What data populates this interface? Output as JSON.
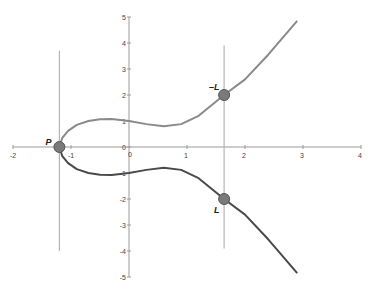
{
  "chart_data": {
    "type": "line",
    "title": "",
    "xlabel": "",
    "ylabel": "",
    "xlim": [
      -2,
      4
    ],
    "ylim": [
      -5,
      5
    ],
    "x_ticks": [
      "-2",
      "-1",
      "0",
      "1",
      "2",
      "3",
      "4"
    ],
    "y_ticks": [
      "5",
      "4",
      "3",
      "2",
      "1",
      "0",
      "-1",
      "-2",
      "-3",
      "-4",
      "-5"
    ],
    "grid": false,
    "series": [
      {
        "name": "upper branch",
        "color": "#8a8a8a",
        "x": [
          -1.2,
          -1.15,
          -1.05,
          -0.9,
          -0.7,
          -0.5,
          -0.3,
          0,
          0.3,
          0.6,
          0.9,
          1.2,
          1.64,
          2.0,
          2.4,
          2.9
        ],
        "y": [
          0,
          0.35,
          0.62,
          0.85,
          1.0,
          1.07,
          1.08,
          1.0,
          0.88,
          0.8,
          0.88,
          1.2,
          2.0,
          2.6,
          3.55,
          4.85
        ]
      },
      {
        "name": "lower branch",
        "color": "#4a4a4a",
        "x": [
          -1.2,
          -1.15,
          -1.05,
          -0.9,
          -0.7,
          -0.5,
          -0.3,
          0,
          0.3,
          0.6,
          0.9,
          1.2,
          1.64,
          2.0,
          2.4,
          2.9
        ],
        "y": [
          0,
          -0.35,
          -0.62,
          -0.85,
          -1.0,
          -1.07,
          -1.08,
          -1.0,
          -0.88,
          -0.8,
          -0.88,
          -1.2,
          -2.0,
          -2.6,
          -3.55,
          -4.85
        ]
      }
    ],
    "vertical_lines": [
      {
        "x": -1.2,
        "y_from": -4.0,
        "y_to": 3.7
      },
      {
        "x": 1.64,
        "y_from": -3.9,
        "y_to": 3.9
      }
    ],
    "points": [
      {
        "label": "P",
        "x": -1.2,
        "y": 0
      },
      {
        "label": "–L",
        "x": 1.64,
        "y": 2.0
      },
      {
        "label": "L",
        "x": 1.64,
        "y": -2.0
      }
    ]
  }
}
